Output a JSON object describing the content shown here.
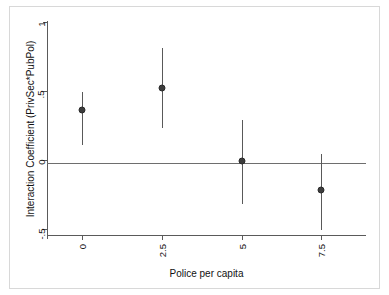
{
  "chart_data": {
    "type": "scatter",
    "title": "",
    "xlabel": "Police per capita",
    "ylabel": "Interaction Coefficient (PrivSec*PubPol)",
    "x": [
      0,
      2.5,
      5,
      7.5
    ],
    "xtick_labels": [
      "0",
      "2.5",
      "5",
      "7.5"
    ],
    "ytick_labels": [
      "1",
      ".5",
      "0",
      "-.5"
    ],
    "ytick_values": [
      1,
      0.5,
      0,
      -0.5
    ],
    "xlim": [
      -1.1,
      8.9
    ],
    "ylim": [
      -0.55,
      1.02
    ],
    "grid": false,
    "legend": null,
    "reference_line_y": 0,
    "marker_color": "#3d3d3d",
    "line_color": "#595959",
    "axis_color": "#5a5a5a",
    "series": [
      {
        "name": "Interaction Coefficient (PrivSec*PubPol)",
        "values": [
          0.36,
          0.52,
          -0.01,
          -0.22
        ],
        "ci_lower": [
          0.11,
          0.23,
          -0.32,
          -0.51
        ],
        "ci_upper": [
          0.49,
          0.81,
          0.29,
          0.04
        ]
      }
    ],
    "points": [
      {
        "x": 0,
        "y": 0.36,
        "ci_lower": 0.11,
        "ci_upper": 0.49
      },
      {
        "x": 2.5,
        "y": 0.52,
        "ci_lower": 0.23,
        "ci_upper": 0.81
      },
      {
        "x": 5,
        "y": -0.01,
        "ci_lower": -0.32,
        "ci_upper": 0.29
      },
      {
        "x": 7.5,
        "y": -0.22,
        "ci_lower": -0.51,
        "ci_upper": 0.04
      }
    ]
  }
}
